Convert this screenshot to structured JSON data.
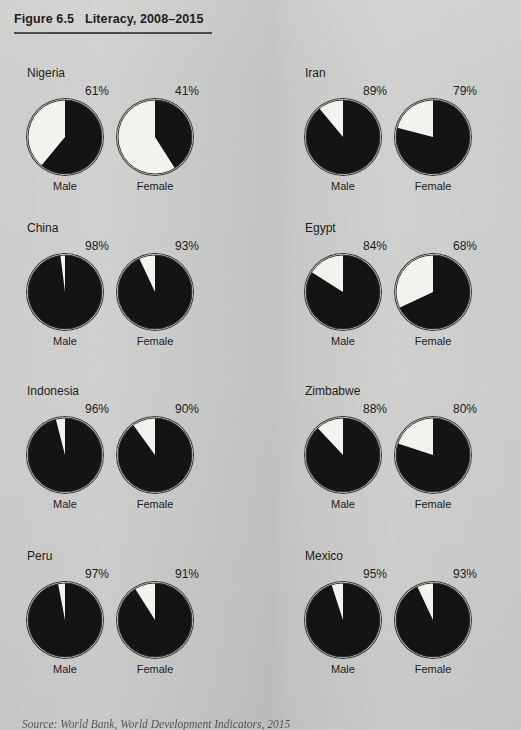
{
  "figure": {
    "number": "Figure 6.5",
    "title": "Literacy, 2008–2015"
  },
  "labels": {
    "male": "Male",
    "female": "Female"
  },
  "source": {
    "prefix": "Source:",
    "text": "World Bank, World Development Indicators, 2015"
  },
  "colors": {
    "page_background": "#cbcbc9",
    "literate_slice": "#141414",
    "illiterate_slice": "#f2f2ef",
    "pie_outline": "#3a3a3a",
    "text": "#1d1d1d",
    "rule": "#4b4b4b"
  },
  "chart_data": {
    "type": "pie",
    "title": "Literacy, 2008–2015",
    "unit": "percent",
    "series": [
      {
        "name": "Literate",
        "color": "#141414"
      },
      {
        "name": "Not literate",
        "color": "#f2f2ef"
      }
    ],
    "categories": [
      "Male",
      "Female"
    ],
    "countries": [
      {
        "name": "Nigeria",
        "male": 61,
        "female": 41
      },
      {
        "name": "Iran",
        "male": 89,
        "female": 79
      },
      {
        "name": "China",
        "male": 98,
        "female": 93
      },
      {
        "name": "Egypt",
        "male": 84,
        "female": 68
      },
      {
        "name": "Indonesia",
        "male": 96,
        "female": 90
      },
      {
        "name": "Zimbabwe",
        "male": 88,
        "female": 80
      },
      {
        "name": "Peru",
        "male": 97,
        "female": 91
      },
      {
        "name": "Mexico",
        "male": 95,
        "female": 93
      }
    ],
    "value_labels": [
      "61%",
      "41%",
      "89%",
      "79%",
      "98%",
      "93%",
      "84%",
      "68%",
      "96%",
      "90%",
      "88%",
      "80%",
      "97%",
      "91%",
      "95%",
      "93%"
    ],
    "legend_position": "none",
    "grid": false
  },
  "layout": {
    "columns": [
      {
        "name_x": 27,
        "pie_male_cx": 65,
        "pie_female_cx": 155
      },
      {
        "name_x": 305,
        "pie_male_cx": 343,
        "pie_female_cx": 433
      }
    ],
    "rows_cy": [
      137,
      292,
      455,
      620
    ],
    "pie_radius": 37
  }
}
